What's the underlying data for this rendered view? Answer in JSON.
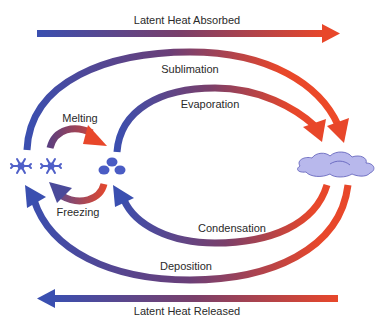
{
  "colors": {
    "cold": "#3a4fb0",
    "hot": "#e8472a",
    "ice": "#5060c8",
    "cloud": "#b8b8ec"
  },
  "top_arrow": {
    "label": "Latent Heat Absorbed",
    "direction": "right"
  },
  "bottom_arrow": {
    "label": "Latent Heat Released",
    "direction": "left"
  },
  "states": {
    "ice": {
      "icon": "snowflake-icon",
      "count": 2
    },
    "liquid": {
      "icon": "water-droplets-icon",
      "count": 3
    },
    "vapor": {
      "icon": "cloud-icon"
    }
  },
  "processes": {
    "sublimation": {
      "label": "Sublimation",
      "from": "ice",
      "to": "vapor"
    },
    "evaporation": {
      "label": "Evaporation",
      "from": "liquid",
      "to": "vapor"
    },
    "melting": {
      "label": "Melting",
      "from": "ice",
      "to": "liquid"
    },
    "freezing": {
      "label": "Freezing",
      "from": "liquid",
      "to": "ice"
    },
    "condensation": {
      "label": "Condensation",
      "from": "vapor",
      "to": "liquid"
    },
    "deposition": {
      "label": "Deposition",
      "from": "vapor",
      "to": "ice"
    }
  }
}
